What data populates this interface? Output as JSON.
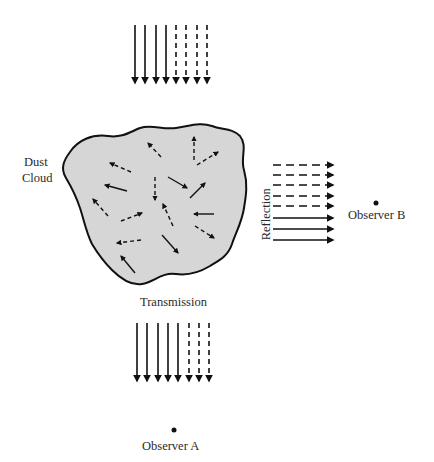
{
  "diagram": {
    "labels": {
      "dust": "Dust",
      "cloud": "Cloud",
      "reflection": "Reflection",
      "transmission": "Transmission",
      "observer_a": "Observer A",
      "observer_b": "Observer B"
    },
    "colors": {
      "cloud_fill": "#d6d6d6",
      "outline": "#111111",
      "arrow": "#111111",
      "background": "#ffffff"
    },
    "incident_beam": {
      "direction": "down",
      "solid_count": 4,
      "dashed_count": 4
    },
    "reflected_beam": {
      "direction": "right",
      "dashed_count": 5,
      "solid_count": 3
    },
    "transmitted_beam": {
      "direction": "down",
      "solid_count": 5,
      "dashed_count": 3
    },
    "scattered_arrows_count": 16
  }
}
